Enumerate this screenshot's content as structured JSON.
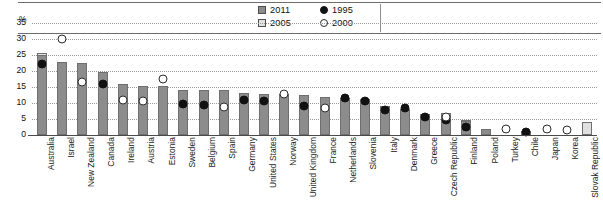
{
  "axis": {
    "unit_label": "%",
    "y_ticks": [
      35,
      30,
      25,
      20,
      15,
      10,
      5,
      0
    ],
    "y_min": 0,
    "y_max": 35
  },
  "legend": {
    "items": [
      {
        "label": "2011",
        "symbol": "filled-square",
        "color": "#8c8c8c"
      },
      {
        "label": "1995",
        "symbol": "filled-circle",
        "color": "#111111"
      },
      {
        "label": "2005",
        "symbol": "light-square",
        "color": "#e2e2e2"
      },
      {
        "label": "2000",
        "symbol": "open-circle",
        "color": "#ffffff"
      }
    ]
  },
  "chart_data": {
    "type": "bar",
    "title": "",
    "subtitle": "",
    "xlabel": "",
    "ylabel": "%",
    "ylim": [
      0,
      35
    ],
    "grid": true,
    "legend_position": "top-center",
    "categories": [
      "Australia",
      "Israel",
      "New Zealand",
      "Canada",
      "Ireland",
      "Austria",
      "Estonia",
      "Sweden",
      "Belgium",
      "Spain",
      "Germany",
      "United States",
      "Norway",
      "United Kingdom",
      "France",
      "Netherlands",
      "Slovenia",
      "Italy",
      "Denmark",
      "Greece",
      "Czech Republic",
      "Finland",
      "Poland",
      "Turkey",
      "Chile",
      "Japan",
      "Korea",
      "Slovak Republic"
    ],
    "series": [
      {
        "name": "2011",
        "symbol": "filled-square",
        "color": "#8c8c8c",
        "values": [
          25.0,
          22.8,
          22.5,
          19.7,
          16.0,
          15.4,
          15.2,
          14.2,
          14.1,
          14.1,
          13.0,
          12.9,
          12.7,
          12.5,
          11.8,
          11.6,
          11.2,
          9.0,
          8.2,
          6.5,
          6.3,
          4.5,
          2.0,
          0.0,
          0.0,
          0.0,
          0.0,
          0.0
        ]
      },
      {
        "name": "2005",
        "symbol": "light-square",
        "color": "#e0e0e0",
        "values": [
          25.6,
          0.0,
          0.0,
          0.0,
          15.6,
          0.0,
          0.0,
          0.0,
          0.0,
          0.0,
          0.0,
          0.0,
          0.0,
          0.0,
          11.9,
          0.0,
          0.0,
          0.0,
          0.0,
          0.0,
          6.8,
          4.8,
          0.0,
          0.0,
          1.2,
          0.0,
          0.0,
          4.2
        ]
      },
      {
        "name": "1995",
        "symbol": "filled-circle",
        "color": "#111111",
        "values": [
          22.3,
          null,
          null,
          16.0,
          null,
          null,
          null,
          9.8,
          9.5,
          null,
          10.9,
          10.7,
          null,
          9.1,
          null,
          11.5,
          10.7,
          7.7,
          8.3,
          5.5,
          4.6,
          2.6,
          null,
          null,
          0.9,
          null,
          null,
          null
        ]
      },
      {
        "name": "2000",
        "symbol": "open-circle",
        "color": "#ffffff",
        "values": [
          null,
          30.0,
          16.5,
          null,
          10.8,
          10.7,
          17.5,
          null,
          null,
          8.7,
          null,
          null,
          12.8,
          null,
          8.3,
          null,
          null,
          null,
          null,
          null,
          5.6,
          null,
          null,
          2.0,
          null,
          2.0,
          1.5,
          null
        ]
      }
    ]
  }
}
